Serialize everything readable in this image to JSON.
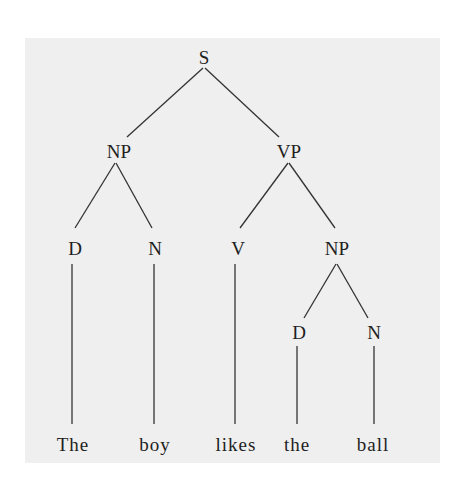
{
  "diagram": {
    "type": "syntax-tree",
    "background_color": "#efefef",
    "line_color": "#333333",
    "text_color": "#1e1e1e",
    "nodes": {
      "root": "S",
      "subject_np": "NP",
      "vp": "VP",
      "subject_det": "D",
      "subject_noun": "N",
      "verb": "V",
      "object_np": "NP",
      "object_det": "D",
      "object_noun": "N"
    },
    "words": [
      "The",
      "boy",
      "likes",
      "the",
      "ball"
    ],
    "structure": {
      "label": "S",
      "children": [
        {
          "label": "NP",
          "children": [
            {
              "label": "D",
              "children": [
                {
                  "label": "The"
                }
              ]
            },
            {
              "label": "N",
              "children": [
                {
                  "label": "boy"
                }
              ]
            }
          ]
        },
        {
          "label": "VP",
          "children": [
            {
              "label": "V",
              "children": [
                {
                  "label": "likes"
                }
              ]
            },
            {
              "label": "NP",
              "children": [
                {
                  "label": "D",
                  "children": [
                    {
                      "label": "the"
                    }
                  ]
                },
                {
                  "label": "N",
                  "children": [
                    {
                      "label": "ball"
                    }
                  ]
                }
              ]
            }
          ]
        }
      ]
    }
  }
}
